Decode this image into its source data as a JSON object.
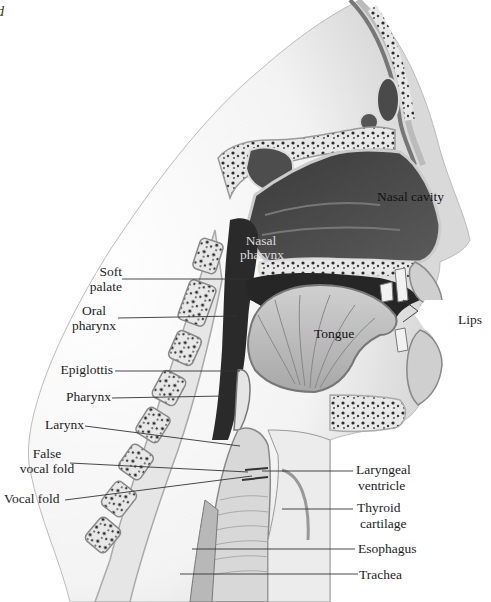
{
  "figure": {
    "panel_letter": "d",
    "labels": {
      "nasal_cavity": "Nasal cavity",
      "nasal_pharynx_1": "Nasal",
      "nasal_pharynx_2": "pharynx",
      "soft_palate_1": "Soft",
      "soft_palate_2": "palate",
      "oral_pharynx_1": "Oral",
      "oral_pharynx_2": "pharynx",
      "tongue": "Tongue",
      "lips": "Lips",
      "epiglottis": "Epiglottis",
      "pharynx": "Pharynx",
      "larynx": "Larynx",
      "false_vocal_fold_1": "False",
      "false_vocal_fold_2": "vocal fold",
      "vocal_fold": "Vocal fold",
      "laryngeal_ventricle_1": "Laryngeal",
      "laryngeal_ventricle_2": "ventricle",
      "thyroid_cartilage_1": "Thyroid",
      "thyroid_cartilage_2": "cartilage",
      "esophagus": "Esophagus",
      "trachea": "Trachea"
    }
  }
}
